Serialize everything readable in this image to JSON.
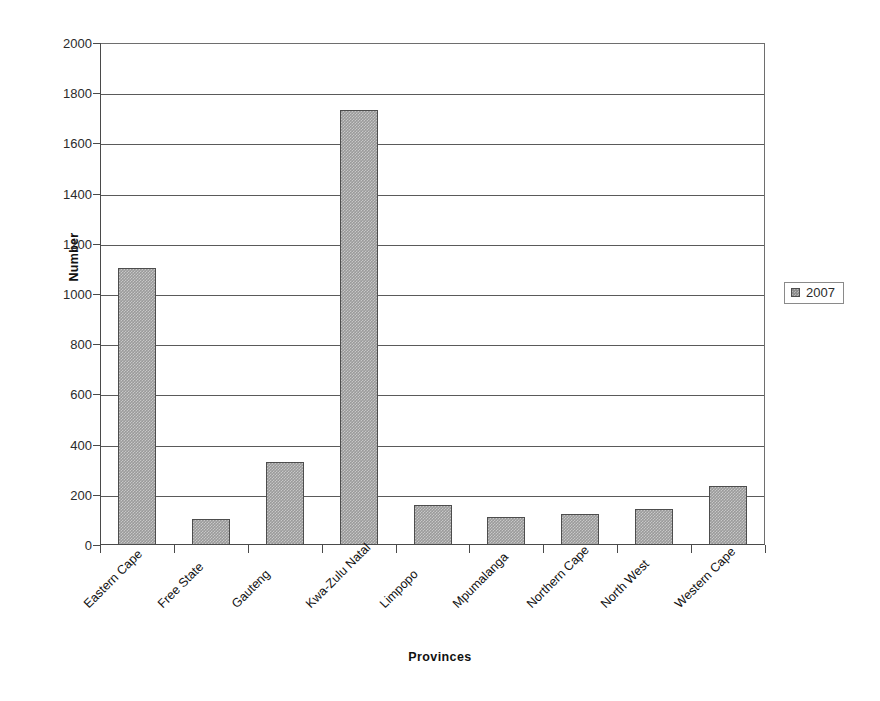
{
  "chart_data": {
    "type": "bar",
    "title": "",
    "xlabel": "Provinces",
    "ylabel": "Number",
    "categories": [
      "Eastern Cape",
      "Free State",
      "Gauteng",
      "Kwa-Zulu Natal",
      "Limpopo",
      "Mpumalanga",
      "Northern Cape",
      "North West",
      "Western Cape"
    ],
    "series": [
      {
        "name": "2007",
        "values": [
          1105,
          105,
          330,
          1735,
          160,
          113,
          122,
          145,
          235
        ]
      }
    ],
    "ylim": [
      0,
      2000
    ],
    "yticks": [
      0,
      200,
      400,
      600,
      800,
      1000,
      1200,
      1400,
      1600,
      1800,
      2000
    ],
    "ytick_labels": [
      "0",
      "200",
      "400",
      "600",
      "800",
      "1000",
      "1200",
      "1400",
      "1600",
      "1800",
      "2000"
    ],
    "grid": "horizontal",
    "legend_position": "right",
    "bar_color": "#9a9a9a",
    "bar_border_color": "#4d4d4d",
    "axis_color": "#4a4a4a",
    "gridline_color": "#5a5a5a"
  },
  "legend": {
    "entries": [
      {
        "label": "2007",
        "swatch_name": "legend-swatch-2007"
      }
    ]
  }
}
